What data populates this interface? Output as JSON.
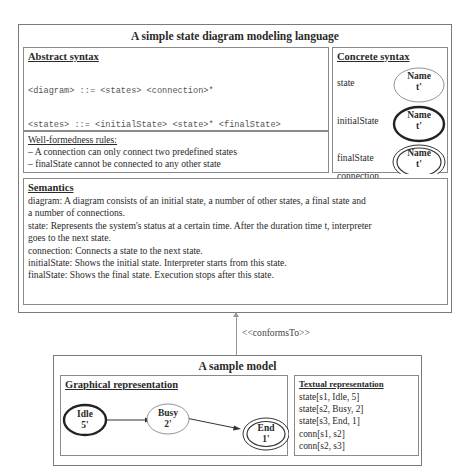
{
  "language": {
    "title": "A simple state diagram modeling language",
    "abstract_syntax": {
      "header": "Abstract syntax",
      "rules": [
        "<diagram> ::= <states> <connection>*",
        "<states> ::= <initialState> <state>* <finalState>",
        "<state> ::= `state[`<stateID>`,` <name>`,` <t>`]`",
        "<initialState> ::= <state>",
        "<finalState> ::= <state>",
        "<connection> ::= `conn[`<stateID>`,` <stateID>`]`"
      ]
    },
    "wellformedness": {
      "header": "Well-formedness rules:",
      "rules": [
        "– A connection can only connect two predefined states",
        "– finalState cannot be connected to any other state"
      ]
    },
    "concrete_syntax": {
      "header": "Concrete syntax",
      "items": [
        {
          "label": "state",
          "name": "Name",
          "time": "t'"
        },
        {
          "label": "initialState",
          "name": "Name",
          "time": "t'"
        },
        {
          "label": "finalState",
          "name": "Name",
          "time": "t'"
        },
        {
          "label": "connection"
        }
      ]
    },
    "semantics": {
      "header": "Semantics",
      "lines": [
        "diagram: A diagram consists of an initial state, a number of other states, a final state and",
        "a number  of connections.",
        "state: Represents the system's status at a certain time. After the duration time t, interpreter",
        "goes to the next state.",
        "connection: Connects a state to the next state.",
        "initialState: Shows the initial state. Interpreter starts from this state.",
        "finalState: Shows the final state. Execution stops after this state."
      ]
    }
  },
  "relation": {
    "label": "<<conformsTo>>"
  },
  "sample_model": {
    "title": "A sample model",
    "graphical": {
      "header": "Graphical representation",
      "states": [
        {
          "name": "Idle",
          "time": "5'",
          "kind": "initial"
        },
        {
          "name": "Busy",
          "time": "2'",
          "kind": "state"
        },
        {
          "name": "End",
          "time": "1'",
          "kind": "final"
        }
      ]
    },
    "textual": {
      "header": "Textual representation",
      "lines": [
        "state[s1, Idle, 5]",
        "state[s2, Busy, 2]",
        "state[s3, End, 1]",
        "conn[s1, s2]",
        "conn[s2, s3]"
      ]
    }
  }
}
